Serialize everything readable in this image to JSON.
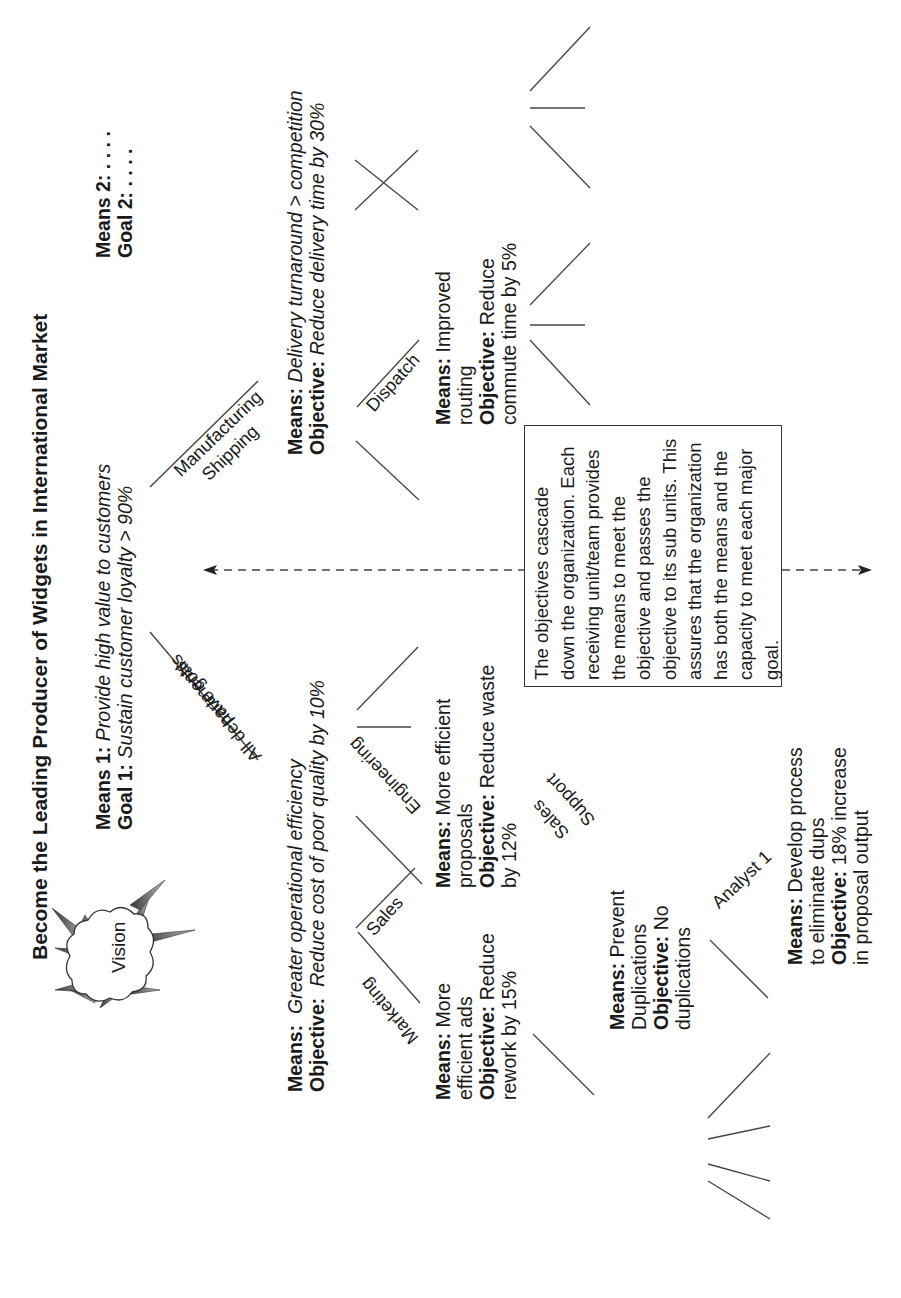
{
  "title": "Become the Leading  Producer of Widgets in International Market",
  "vision": {
    "label": "Vision"
  },
  "top_goals": {
    "means1_label": "Means 1:",
    "means1_text": "Provide high value to customers",
    "goal1_label": "Goal 1:",
    "goal1_text": "Sustain customer loyalty > 90%",
    "means2_label": "Means 2:",
    "means2_text": ". . . .",
    "goal2_label": "Goal 2:",
    "goal2_text": ". . . ."
  },
  "branches": {
    "left": {
      "top_label": "All departments",
      "bottom_label": "have goals"
    },
    "right": {
      "top_label": "Manufacturing",
      "bottom_label": "Shipping"
    }
  },
  "left_level": {
    "means_label": "Means:",
    "means_text": "Greater operational efficiency",
    "objective_label": "Objective:",
    "objective_text": "Reduce cost of poor quality by 10%"
  },
  "right_level": {
    "means_label": "Means:",
    "means_text": "Delivery turnaround > competition",
    "objective_label": "Objective:",
    "objective_text": "Reduce delivery time by 30%"
  },
  "departments": {
    "marketing": "Marketing",
    "sales": "Sales",
    "engineering": "Engineering",
    "dispatch": "Dispatch",
    "sales_support_top": "Sales",
    "sales_support_bottom": "Support",
    "analyst": "Analyst 1"
  },
  "marketing_box": {
    "means_label": "Means:",
    "means_lines": [
      "More",
      "efficient ads"
    ],
    "objective_label": "Objective:",
    "objective_lines": [
      "Reduce",
      "rework by 15%"
    ]
  },
  "sales_box": {
    "means_label": "Means:",
    "means_lines": [
      "More efficient",
      "proposals"
    ],
    "objective_label": "Objective:",
    "objective_lines": [
      "Reduce waste",
      "by 12%"
    ]
  },
  "dispatch_box": {
    "means_label": "Means:",
    "means_lines": [
      "Improved",
      "routing"
    ],
    "objective_label": "Objective:",
    "objective_lines": [
      "Reduce",
      "commute time by 5%"
    ]
  },
  "support_box": {
    "means_label": "Means:",
    "means_lines": [
      "Prevent",
      "Duplications"
    ],
    "objective_label": "Objective:",
    "objective_lines": [
      "No",
      "duplications"
    ]
  },
  "analyst_box": {
    "means_label": "Means:",
    "means_lines": [
      "Develop process",
      "to eliminate dups"
    ],
    "objective_label": "Objective:",
    "objective_lines": [
      "18% increase",
      "in proposal output"
    ]
  },
  "note": {
    "text": "The objectives cascade down the organization. Each receiving unit/team provides the means to meet the objective and passes the objective to its sub units. This assures that the organization has both the means and the capacity to meet each major goal."
  },
  "colors": {
    "ink": "#1a1a1a",
    "line": "#444444",
    "spike": "#666666",
    "background": "#ffffff"
  }
}
